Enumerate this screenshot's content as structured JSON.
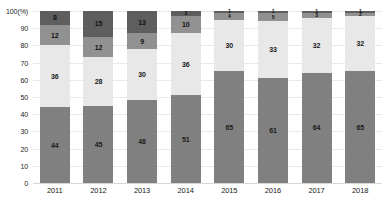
{
  "chart_data": {
    "type": "bar",
    "stacked": true,
    "title": "",
    "xlabel": "",
    "ylabel": "100(%)",
    "ylim": [
      0,
      100
    ],
    "grid": true,
    "legend": "none",
    "orientation": "vertical",
    "categories": [
      "2011",
      "2012",
      "2013",
      "2014",
      "2015",
      "2016",
      "2017",
      "2018"
    ],
    "ytick_labels": [
      "100(%)",
      "90",
      "80",
      "70",
      "60",
      "50",
      "40",
      "30",
      "20",
      "10",
      "0"
    ],
    "ytick_values": [
      100,
      90,
      80,
      70,
      60,
      50,
      40,
      30,
      20,
      10,
      0
    ],
    "series": [
      {
        "name": "segment-1-bottom",
        "color": "#808080",
        "values": [
          44,
          45,
          48,
          51,
          65,
          61,
          64,
          65
        ]
      },
      {
        "name": "segment-2-light",
        "color": "#e8e8e8",
        "values": [
          36,
          28,
          30,
          36,
          30,
          33,
          32,
          32
        ]
      },
      {
        "name": "segment-3-medium",
        "color": "#919191",
        "values": [
          12,
          12,
          9,
          10,
          4,
          5,
          3,
          2
        ]
      },
      {
        "name": "segment-4-top-dark",
        "color": "#5e5e5e",
        "values": [
          8,
          15,
          13,
          3,
          1,
          1,
          1,
          1
        ]
      }
    ]
  },
  "colors": {
    "gridline": "#e9e9e9",
    "baseline": "#d7d7d7",
    "background": "#ffffff",
    "label_text": "#1a1a1a",
    "axis_text": "#222222"
  }
}
